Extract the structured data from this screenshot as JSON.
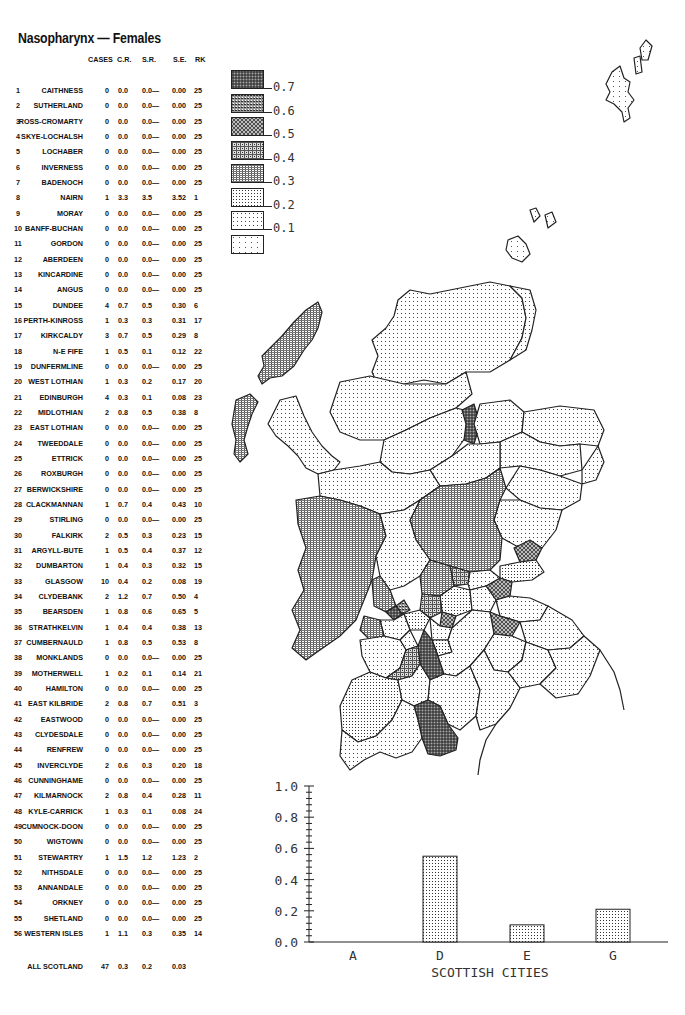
{
  "title": "Nasopharynx — Females",
  "table": {
    "headers": {
      "cases": "CASES",
      "cr": "C.R.",
      "sr": "S.R.",
      "se": "S.E.",
      "rk": "RK"
    },
    "rows": [
      {
        "num": "1",
        "name": "CAITHNESS",
        "cases": "0",
        "cr": "0.0",
        "sr": "0.0—",
        "se": "0.00",
        "rk": "25"
      },
      {
        "num": "2",
        "name": "SUTHERLAND",
        "cases": "0",
        "cr": "0.0",
        "sr": "0.0—",
        "se": "0.00",
        "rk": "25"
      },
      {
        "num": "3",
        "name": "ROSS-CROMARTY",
        "cases": "0",
        "cr": "0.0",
        "sr": "0.0—",
        "se": "0.00",
        "rk": "25"
      },
      {
        "num": "4",
        "name": "SKYE-LOCHALSH",
        "cases": "0",
        "cr": "0.0",
        "sr": "0.0—",
        "se": "0.00",
        "rk": "25"
      },
      {
        "num": "5",
        "name": "LOCHABER",
        "cases": "0",
        "cr": "0.0",
        "sr": "0.0—",
        "se": "0.00",
        "rk": "25"
      },
      {
        "num": "6",
        "name": "INVERNESS",
        "cases": "0",
        "cr": "0.0",
        "sr": "0.0—",
        "se": "0.00",
        "rk": "25"
      },
      {
        "num": "7",
        "name": "BADENOCH",
        "cases": "0",
        "cr": "0.0",
        "sr": "0.0—",
        "se": "0.00",
        "rk": "25"
      },
      {
        "num": "8",
        "name": "NAIRN",
        "cases": "1",
        "cr": "3.3",
        "sr": "3.5",
        "se": "3.52",
        "rk": "1"
      },
      {
        "num": "9",
        "name": "MORAY",
        "cases": "0",
        "cr": "0.0",
        "sr": "0.0—",
        "se": "0.00",
        "rk": "25"
      },
      {
        "num": "10",
        "name": "BANFF-BUCHAN",
        "cases": "0",
        "cr": "0.0",
        "sr": "0.0—",
        "se": "0.00",
        "rk": "25"
      },
      {
        "num": "11",
        "name": "GORDON",
        "cases": "0",
        "cr": "0.0",
        "sr": "0.0—",
        "se": "0.00",
        "rk": "25"
      },
      {
        "num": "12",
        "name": "ABERDEEN",
        "cases": "0",
        "cr": "0.0",
        "sr": "0.0—",
        "se": "0.00",
        "rk": "25"
      },
      {
        "num": "13",
        "name": "KINCARDINE",
        "cases": "0",
        "cr": "0.0",
        "sr": "0.0—",
        "se": "0.00",
        "rk": "25"
      },
      {
        "num": "14",
        "name": "ANGUS",
        "cases": "0",
        "cr": "0.0",
        "sr": "0.0—",
        "se": "0.00",
        "rk": "25"
      },
      {
        "num": "15",
        "name": "DUNDEE",
        "cases": "4",
        "cr": "0.7",
        "sr": "0.5",
        "se": "0.30",
        "rk": "6"
      },
      {
        "num": "16",
        "name": "PERTH-KINROSS",
        "cases": "1",
        "cr": "0.3",
        "sr": "0.3",
        "se": "0.31",
        "rk": "17"
      },
      {
        "num": "17",
        "name": "KIRKCALDY",
        "cases": "3",
        "cr": "0.7",
        "sr": "0.5",
        "se": "0.29",
        "rk": "8"
      },
      {
        "num": "18",
        "name": "N-E FIFE",
        "cases": "1",
        "cr": "0.5",
        "sr": "0.1",
        "se": "0.12",
        "rk": "22"
      },
      {
        "num": "19",
        "name": "DUNFERMLINE",
        "cases": "0",
        "cr": "0.0",
        "sr": "0.0—",
        "se": "0.00",
        "rk": "25"
      },
      {
        "num": "20",
        "name": "WEST LOTHIAN",
        "cases": "1",
        "cr": "0.3",
        "sr": "0.2",
        "se": "0.17",
        "rk": "20"
      },
      {
        "num": "21",
        "name": "EDINBURGH",
        "cases": "4",
        "cr": "0.3",
        "sr": "0.1",
        "se": "0.08",
        "rk": "23"
      },
      {
        "num": "22",
        "name": "MIDLOTHIAN",
        "cases": "2",
        "cr": "0.8",
        "sr": "0.5",
        "se": "0.38",
        "rk": "8"
      },
      {
        "num": "23",
        "name": "EAST LOTHIAN",
        "cases": "0",
        "cr": "0.0",
        "sr": "0.0—",
        "se": "0.00",
        "rk": "25"
      },
      {
        "num": "24",
        "name": "TWEEDDALE",
        "cases": "0",
        "cr": "0.0",
        "sr": "0.0—",
        "se": "0.00",
        "rk": "25"
      },
      {
        "num": "25",
        "name": "ETTRICK",
        "cases": "0",
        "cr": "0.0",
        "sr": "0.0—",
        "se": "0.00",
        "rk": "25"
      },
      {
        "num": "26",
        "name": "ROXBURGH",
        "cases": "0",
        "cr": "0.0",
        "sr": "0.0—",
        "se": "0.00",
        "rk": "25"
      },
      {
        "num": "27",
        "name": "BERWICKSHIRE",
        "cases": "0",
        "cr": "0.0",
        "sr": "0.0—",
        "se": "0.00",
        "rk": "25"
      },
      {
        "num": "28",
        "name": "CLACKMANNAN",
        "cases": "1",
        "cr": "0.7",
        "sr": "0.4",
        "se": "0.43",
        "rk": "10"
      },
      {
        "num": "29",
        "name": "STIRLING",
        "cases": "0",
        "cr": "0.0",
        "sr": "0.0—",
        "se": "0.00",
        "rk": "25"
      },
      {
        "num": "30",
        "name": "FALKIRK",
        "cases": "2",
        "cr": "0.5",
        "sr": "0.3",
        "se": "0.23",
        "rk": "15"
      },
      {
        "num": "31",
        "name": "ARGYLL-BUTE",
        "cases": "1",
        "cr": "0.5",
        "sr": "0.4",
        "se": "0.37",
        "rk": "12"
      },
      {
        "num": "32",
        "name": "DUMBARTON",
        "cases": "1",
        "cr": "0.4",
        "sr": "0.3",
        "se": "0.32",
        "rk": "15"
      },
      {
        "num": "33",
        "name": "GLASGOW",
        "cases": "10",
        "cr": "0.4",
        "sr": "0.2",
        "se": "0.08",
        "rk": "19"
      },
      {
        "num": "34",
        "name": "CLYDEBANK",
        "cases": "2",
        "cr": "1.2",
        "sr": "0.7",
        "se": "0.50",
        "rk": "4"
      },
      {
        "num": "35",
        "name": "BEARSDEN",
        "cases": "1",
        "cr": "0.8",
        "sr": "0.6",
        "se": "0.65",
        "rk": "5"
      },
      {
        "num": "36",
        "name": "STRATHKELVIN",
        "cases": "1",
        "cr": "0.4",
        "sr": "0.4",
        "se": "0.38",
        "rk": "13"
      },
      {
        "num": "37",
        "name": "CUMBERNAULD",
        "cases": "1",
        "cr": "0.8",
        "sr": "0.5",
        "se": "0.53",
        "rk": "8"
      },
      {
        "num": "38",
        "name": "MONKLANDS",
        "cases": "0",
        "cr": "0.0",
        "sr": "0.0—",
        "se": "0.00",
        "rk": "25"
      },
      {
        "num": "39",
        "name": "MOTHERWELL",
        "cases": "1",
        "cr": "0.2",
        "sr": "0.1",
        "se": "0.14",
        "rk": "21"
      },
      {
        "num": "40",
        "name": "HAMILTON",
        "cases": "0",
        "cr": "0.0",
        "sr": "0.0—",
        "se": "0.00",
        "rk": "25"
      },
      {
        "num": "41",
        "name": "EAST KILBRIDE",
        "cases": "2",
        "cr": "0.8",
        "sr": "0.7",
        "se": "0.51",
        "rk": "3"
      },
      {
        "num": "42",
        "name": "EASTWOOD",
        "cases": "0",
        "cr": "0.0",
        "sr": "0.0—",
        "se": "0.00",
        "rk": "25"
      },
      {
        "num": "43",
        "name": "CLYDESDALE",
        "cases": "0",
        "cr": "0.0",
        "sr": "0.0—",
        "se": "0.00",
        "rk": "25"
      },
      {
        "num": "44",
        "name": "RENFREW",
        "cases": "0",
        "cr": "0.0",
        "sr": "0.0—",
        "se": "0.00",
        "rk": "25"
      },
      {
        "num": "45",
        "name": "INVERCLYDE",
        "cases": "2",
        "cr": "0.6",
        "sr": "0.3",
        "se": "0.20",
        "rk": "18"
      },
      {
        "num": "46",
        "name": "CUNNINGHAME",
        "cases": "0",
        "cr": "0.0",
        "sr": "0.0—",
        "se": "0.00",
        "rk": "25"
      },
      {
        "num": "47",
        "name": "KILMARNOCK",
        "cases": "2",
        "cr": "0.8",
        "sr": "0.4",
        "se": "0.28",
        "rk": "11"
      },
      {
        "num": "48",
        "name": "KYLE-CARRICK",
        "cases": "1",
        "cr": "0.3",
        "sr": "0.1",
        "se": "0.08",
        "rk": "24"
      },
      {
        "num": "49",
        "name": "CUMNOCK-DOON",
        "cases": "0",
        "cr": "0.0",
        "sr": "0.0—",
        "se": "0.00",
        "rk": "25"
      },
      {
        "num": "50",
        "name": "WIGTOWN",
        "cases": "0",
        "cr": "0.0",
        "sr": "0.0—",
        "se": "0.00",
        "rk": "25"
      },
      {
        "num": "51",
        "name": "STEWARTRY",
        "cases": "1",
        "cr": "1.5",
        "sr": "1.2",
        "se": "1.23",
        "rk": "2"
      },
      {
        "num": "52",
        "name": "NITHSDALE",
        "cases": "0",
        "cr": "0.0",
        "sr": "0.0—",
        "se": "0.00",
        "rk": "25"
      },
      {
        "num": "53",
        "name": "ANNANDALE",
        "cases": "0",
        "cr": "0.0",
        "sr": "0.0—",
        "se": "0.00",
        "rk": "25"
      },
      {
        "num": "54",
        "name": "ORKNEY",
        "cases": "0",
        "cr": "0.0",
        "sr": "0.0—",
        "se": "0.00",
        "rk": "25"
      },
      {
        "num": "55",
        "name": "SHETLAND",
        "cases": "0",
        "cr": "0.0",
        "sr": "0.0—",
        "se": "0.00",
        "rk": "25"
      },
      {
        "num": "56",
        "name": "WESTERN ISLES",
        "cases": "1",
        "cr": "1.1",
        "sr": "0.3",
        "se": "0.35",
        "rk": "14"
      }
    ],
    "total": {
      "name": "ALL SCOTLAND",
      "cases": "47",
      "cr": "0.3",
      "sr": "0.2",
      "se": "0.03"
    }
  },
  "legend": {
    "items": [
      {
        "label": "0.7",
        "pattern": "p7"
      },
      {
        "label": "0.6",
        "pattern": "p6"
      },
      {
        "label": "0.5",
        "pattern": "p5"
      },
      {
        "label": "0.4",
        "pattern": "p4"
      },
      {
        "label": "0.3",
        "pattern": "p3"
      },
      {
        "label": "0.2",
        "pattern": "p2"
      },
      {
        "label": "0.1",
        "pattern": "p1"
      },
      {
        "label": "",
        "pattern": "p0"
      }
    ]
  },
  "chart_data": [
    {
      "type": "table",
      "title": "Nasopharynx — Females",
      "columns": [
        "#",
        "District",
        "CASES",
        "C.R.",
        "S.R.",
        "S.E.",
        "RK"
      ],
      "note": "Full district rows in table.rows; ALL SCOTLAND: 47 cases, C.R. 0.3, S.R. 0.2, S.E. 0.03"
    },
    {
      "type": "bar",
      "title": "",
      "categories": [
        "A",
        "D",
        "E",
        "G"
      ],
      "values": [
        0.0,
        0.55,
        0.11,
        0.21
      ],
      "xlabel": "SCOTTISH CITIES",
      "ylabel": "",
      "ylim": [
        0.0,
        1.0
      ],
      "yticks": [
        "0.0",
        "0.2",
        "0.4",
        "0.6",
        "0.8",
        "1.0"
      ],
      "grid": false
    },
    {
      "type": "heatmap",
      "title": "Choropleth map of Scottish districts (S.R.)",
      "legend_breaks": [
        "0.1",
        "0.2",
        "0.3",
        "0.4",
        "0.5",
        "0.6",
        "0.7"
      ]
    }
  ]
}
